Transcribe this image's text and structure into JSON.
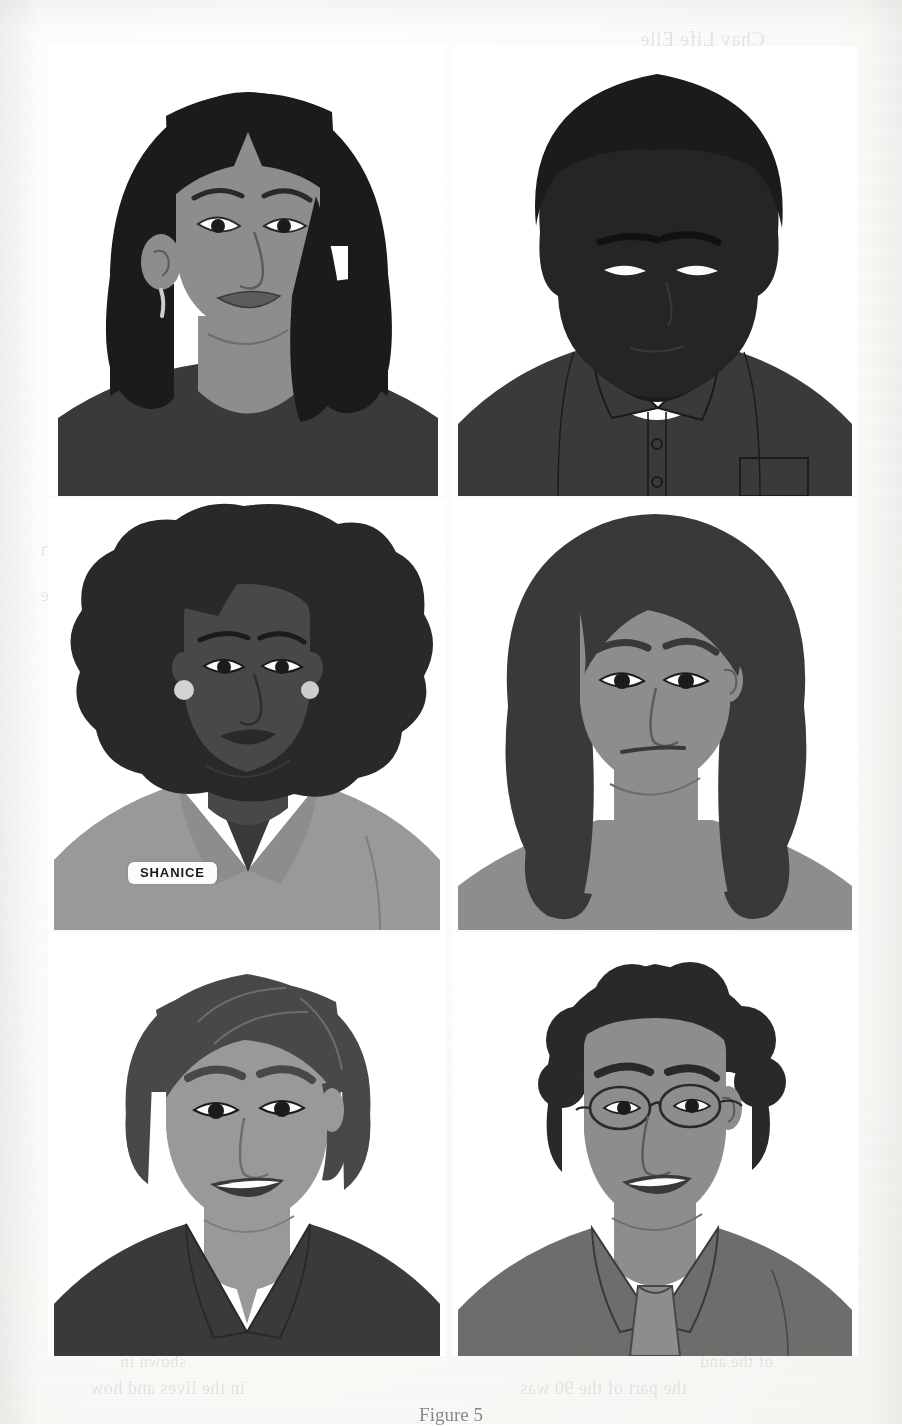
{
  "page": {
    "kind": "scanned-page",
    "background_color": "#fdfdfc",
    "caption_partial": "Figure 5"
  },
  "show_through_text": [
    {
      "text": "Chay Life Elle",
      "x": 640,
      "y": 28,
      "size": 20
    },
    {
      "text": "We had this same attention to detail",
      "x": 60,
      "y": 512,
      "size": 22
    },
    {
      "text": "behaviors to help identify the play with",
      "x": 40,
      "y": 536,
      "size": 22
    },
    {
      "text": "learning the same in reading the",
      "x": 60,
      "y": 560,
      "size": 20
    },
    {
      "text": "of the children and the",
      "x": 40,
      "y": 584,
      "size": 19
    },
    {
      "text": "and the in",
      "x": 700,
      "y": 610,
      "size": 18
    },
    {
      "text": "the part of the 90 was",
      "x": 520,
      "y": 1378,
      "size": 18
    },
    {
      "text": "in the lives and how",
      "x": 90,
      "y": 1378,
      "size": 18
    },
    {
      "text": "shown in",
      "x": 120,
      "y": 1352,
      "size": 17
    },
    {
      "text": "of the and",
      "x": 700,
      "y": 1352,
      "size": 17
    }
  ],
  "palette": {
    "hair_black": "#1c1a1a",
    "hair_dark": "#3a3838",
    "hair_mid": "#4a4747",
    "skin_light": "#a9a7a5",
    "skin_mid": "#8f8d8b",
    "skin_dark": "#5e5c5b",
    "skin_darkest": "#2a2828",
    "shirt_dark": "#3b3939",
    "shirt_mid": "#6f6d6c",
    "shirt_light": "#9b9997",
    "white": "#fbfbfa",
    "line": "#2a2828",
    "badge_bg": "#fbfbfa",
    "badge_text": "#1a1a1a"
  },
  "portraits": [
    {
      "id": "portrait-1",
      "position": "row1-left",
      "description": "Woman with long straight black hair and blunt bangs",
      "hair": "long straight black with bangs",
      "skin": "medium",
      "accessories": [
        "dangling earring"
      ],
      "clothing": "dark gray crew-neck top",
      "expression": "slight smile",
      "name_badge": null
    },
    {
      "id": "portrait-2",
      "position": "row1-right",
      "description": "Man with very dark skin and short dark hair",
      "hair": "short dark",
      "skin": "very dark",
      "accessories": [],
      "clothing": "dark collared button-down shirt with chest pocket over white t-shirt",
      "expression": "neutral",
      "name_badge": null
    },
    {
      "id": "portrait-3",
      "position": "row2-left",
      "description": "Woman with a large afro wearing a name badge",
      "hair": "large afro",
      "skin": "dark",
      "accessories": [
        "round pearl earrings"
      ],
      "clothing": "light gray blazer",
      "expression": "neutral",
      "name_badge": "SHANICE"
    },
    {
      "id": "portrait-4",
      "position": "row2-right",
      "description": "Woman with long wavy dark hair",
      "hair": "long wavy dark",
      "skin": "medium",
      "accessories": [],
      "clothing": "gray top",
      "expression": "neutral",
      "name_badge": null
    },
    {
      "id": "portrait-5",
      "position": "row3-left",
      "description": "Smiling person with a short dark bob haircut",
      "hair": "short dark bob",
      "skin": "light",
      "accessories": [],
      "clothing": "dark collared shirt",
      "expression": "smiling",
      "name_badge": null
    },
    {
      "id": "portrait-6",
      "position": "row3-right",
      "description": "Smiling man with curly dark hair and wire-frame glasses",
      "hair": "short curly dark",
      "skin": "medium-light",
      "accessories": [
        "wire-frame glasses"
      ],
      "clothing": "gray collared shirt with tie",
      "expression": "smiling",
      "name_badge": null
    }
  ],
  "badges": [
    {
      "id": "badge-shanice",
      "label": "SHANICE",
      "on_portrait": "portrait-3"
    }
  ]
}
